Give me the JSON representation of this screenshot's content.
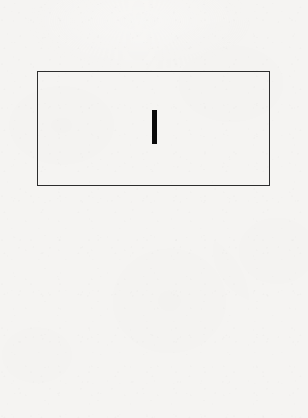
{
  "canvas": {
    "width": 308,
    "height": 418,
    "background_color": "#f5f4f2",
    "surface": "paper-texture"
  },
  "text_input": {
    "role": "text-input-field",
    "state": "focused-empty",
    "value": "",
    "placeholder": "",
    "border_color": "#2d2d2d",
    "border_width_px": 1.5,
    "fill_color": "transparent",
    "x": 37,
    "y": 71,
    "width": 233,
    "height": 115
  },
  "caret": {
    "role": "text-cursor",
    "visible": true,
    "color": "#0a0a0a",
    "x": 152,
    "y": 110,
    "width": 5,
    "height": 34
  }
}
